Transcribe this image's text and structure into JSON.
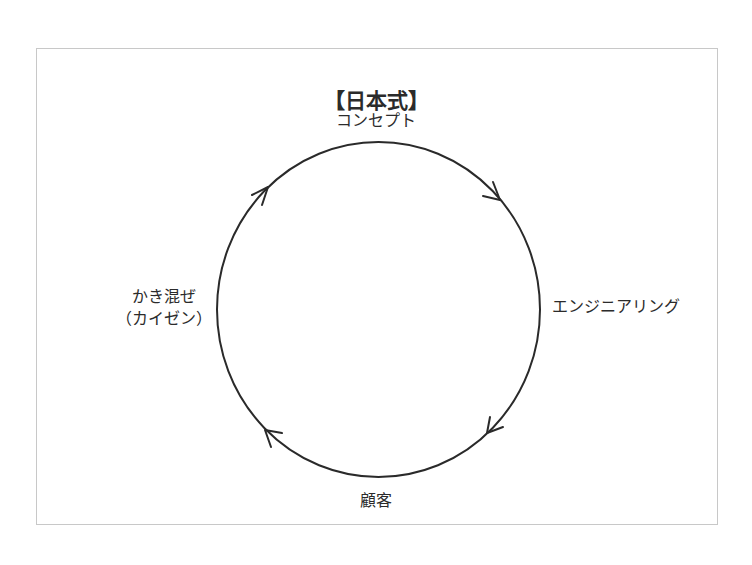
{
  "diagram": {
    "title": "【日本式】",
    "nodes": {
      "top": "コンセプト",
      "right": "エンジニアリング",
      "bottom": "顧客",
      "left_line1": "かき混ぜ",
      "left_line2": "（カイゼン）"
    },
    "cycle": {
      "direction": "clockwise",
      "sequence": [
        "コンセプト",
        "エンジニアリング",
        "顧客",
        "かき混ぜ（カイゼン）"
      ],
      "stroke_color": "#2a2a2a"
    },
    "frame_color": "#c8c8c8"
  }
}
